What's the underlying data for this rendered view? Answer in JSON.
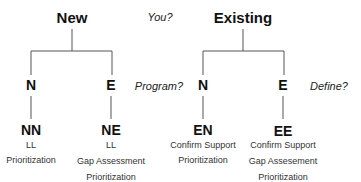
{
  "trees": [
    {
      "root": {
        "label": "New"
      },
      "branches": [
        {
          "label": "N",
          "leaf": {
            "code": "NN",
            "items": [
              "LL",
              "Prioritization"
            ]
          }
        },
        {
          "label": "E",
          "leaf": {
            "code": "NE",
            "items": [
              "LL",
              "Gap Assessment",
              "Prioritization"
            ]
          }
        }
      ]
    },
    {
      "root": {
        "label": "Existing"
      },
      "branches": [
        {
          "label": "N",
          "leaf": {
            "code": "EN",
            "items": [
              "Confirm Support",
              "Prioritization"
            ]
          }
        },
        {
          "label": "E",
          "leaf": {
            "code": "EE",
            "items": [
              "Confirm Support",
              "Gap Assesement",
              "Prioritization"
            ]
          }
        }
      ]
    }
  ],
  "questions": {
    "level1": "You?",
    "level2_left": "Program?",
    "level2_right": "Define?"
  },
  "colors": {
    "line": "#555555",
    "text": "#111111"
  }
}
